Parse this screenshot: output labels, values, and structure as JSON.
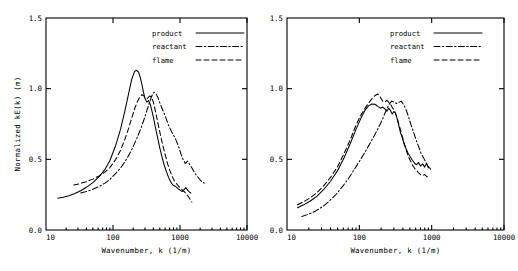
{
  "figure": {
    "panels": [
      {
        "id": "left",
        "axis": {
          "xlabel": "Wavenumber, k (1/m)",
          "ylabel": "Normalized kE(k)  (m)",
          "xticks": [
            "10",
            "100",
            "1000",
            "10000"
          ],
          "yticks": [
            "0.0",
            "0.5",
            "1.0",
            "1.5"
          ]
        },
        "legend": [
          {
            "label": "product",
            "style": "solid"
          },
          {
            "label": "reactant",
            "style": "dashdot"
          },
          {
            "label": "flame",
            "style": "dashed"
          }
        ]
      },
      {
        "id": "right",
        "axis": {
          "xlabel": "Wavenumber, k (1/m)",
          "ylabel": "",
          "xticks": [
            "10",
            "100",
            "1000",
            "10000"
          ],
          "yticks": [
            "0.0",
            "0.5",
            "1.0",
            "1.5"
          ]
        },
        "legend": [
          {
            "label": "product",
            "style": "solid"
          },
          {
            "label": "reactant",
            "style": "dashdot"
          },
          {
            "label": "flame",
            "style": "dashed"
          }
        ]
      }
    ]
  },
  "chart_data": [
    {
      "type": "line",
      "panel": "left",
      "title": "",
      "xlabel": "Wavenumber, k (1/m)",
      "ylabel": "Normalized kE(k)  (m)",
      "xscale": "log",
      "yscale": "linear",
      "xlim": [
        10,
        10000
      ],
      "ylim": [
        0.0,
        1.5
      ],
      "xticks": [
        10,
        100,
        1000,
        10000
      ],
      "yticks": [
        0.0,
        0.5,
        1.0,
        1.5
      ],
      "grid": false,
      "legend_position": "upper-center",
      "series": [
        {
          "name": "product",
          "style": "solid",
          "x": [
            15,
            18,
            22,
            27,
            33,
            40,
            50,
            62,
            75,
            90,
            110,
            130,
            150,
            170,
            190,
            210,
            225,
            240,
            255,
            270,
            285,
            300,
            320,
            340,
            360,
            380,
            400,
            430,
            460,
            500,
            540,
            580,
            620,
            660,
            700,
            750,
            800,
            850,
            900,
            960,
            1020,
            1080,
            1150,
            1220,
            1300,
            1380,
            1450
          ],
          "y": [
            0.225,
            0.232,
            0.243,
            0.258,
            0.278,
            0.302,
            0.335,
            0.378,
            0.425,
            0.492,
            0.6,
            0.715,
            0.84,
            0.96,
            1.065,
            1.122,
            1.13,
            1.118,
            1.08,
            1.03,
            0.975,
            0.93,
            0.905,
            0.915,
            0.89,
            0.845,
            0.8,
            0.725,
            0.66,
            0.58,
            0.515,
            0.46,
            0.42,
            0.385,
            0.355,
            0.33,
            0.315,
            0.31,
            0.3,
            0.288,
            0.28,
            0.272,
            0.285,
            0.3,
            0.282,
            0.27,
            0.262
          ]
        },
        {
          "name": "flame",
          "style": "dashed",
          "x": [
            26,
            32,
            40,
            50,
            62,
            75,
            90,
            110,
            130,
            150,
            170,
            190,
            210,
            230,
            250,
            270,
            290,
            310,
            330,
            350,
            375,
            400,
            420,
            440,
            460,
            490,
            520,
            560,
            600,
            650,
            700,
            760,
            820,
            880,
            950,
            1020,
            1100,
            1180,
            1260,
            1340,
            1420,
            1500
          ],
          "y": [
            0.318,
            0.328,
            0.342,
            0.36,
            0.382,
            0.408,
            0.442,
            0.5,
            0.565,
            0.64,
            0.715,
            0.79,
            0.858,
            0.905,
            0.94,
            0.958,
            0.948,
            0.93,
            0.932,
            0.948,
            0.94,
            0.905,
            0.862,
            0.818,
            0.775,
            0.712,
            0.655,
            0.59,
            0.535,
            0.472,
            0.425,
            0.382,
            0.35,
            0.33,
            0.31,
            0.295,
            0.28,
            0.268,
            0.252,
            0.235,
            0.215,
            0.198
          ]
        },
        {
          "name": "reactant",
          "style": "dashdot",
          "x": [
            33,
            40,
            50,
            62,
            75,
            90,
            110,
            130,
            150,
            175,
            200,
            230,
            260,
            290,
            320,
            350,
            380,
            410,
            440,
            470,
            500,
            540,
            580,
            620,
            670,
            720,
            780,
            840,
            900,
            970,
            1040,
            1120,
            1200,
            1300,
            1400,
            1500,
            1620,
            1750,
            1880,
            2000,
            2150,
            2300
          ],
          "y": [
            0.262,
            0.272,
            0.288,
            0.308,
            0.33,
            0.358,
            0.4,
            0.44,
            0.482,
            0.535,
            0.59,
            0.655,
            0.718,
            0.782,
            0.845,
            0.9,
            0.95,
            0.975,
            0.962,
            0.935,
            0.9,
            0.86,
            0.825,
            0.79,
            0.745,
            0.712,
            0.68,
            0.655,
            0.62,
            0.58,
            0.535,
            0.495,
            0.47,
            0.488,
            0.462,
            0.44,
            0.412,
            0.388,
            0.37,
            0.355,
            0.34,
            0.332
          ]
        }
      ]
    },
    {
      "type": "line",
      "panel": "right",
      "title": "",
      "xlabel": "Wavenumber, k (1/m)",
      "ylabel": "",
      "xscale": "log",
      "yscale": "linear",
      "xlim": [
        10,
        10000
      ],
      "ylim": [
        0.0,
        1.5
      ],
      "xticks": [
        10,
        100,
        1000,
        10000
      ],
      "yticks": [
        0.0,
        0.5,
        1.0,
        1.5
      ],
      "grid": false,
      "legend_position": "upper-center",
      "series": [
        {
          "name": "product",
          "style": "solid",
          "x": [
            14,
            17,
            21,
            26,
            32,
            40,
            50,
            62,
            75,
            90,
            105,
            120,
            135,
            150,
            165,
            180,
            195,
            210,
            225,
            240,
            255,
            270,
            285,
            300,
            315,
            330,
            350,
            370,
            390,
            415,
            440,
            470,
            500,
            540,
            580,
            620,
            660,
            700,
            750,
            800,
            850,
            900
          ],
          "y": [
            0.158,
            0.178,
            0.205,
            0.24,
            0.285,
            0.345,
            0.42,
            0.515,
            0.612,
            0.712,
            0.79,
            0.848,
            0.88,
            0.892,
            0.89,
            0.875,
            0.862,
            0.87,
            0.858,
            0.84,
            0.862,
            0.845,
            0.82,
            0.838,
            0.828,
            0.795,
            0.742,
            0.69,
            0.658,
            0.612,
            0.578,
            0.545,
            0.522,
            0.495,
            0.472,
            0.462,
            0.478,
            0.452,
            0.468,
            0.445,
            0.47,
            0.44
          ]
        },
        {
          "name": "flame",
          "style": "dashed",
          "x": [
            14,
            17,
            21,
            26,
            32,
            40,
            50,
            62,
            75,
            90,
            105,
            120,
            135,
            150,
            165,
            180,
            195,
            210,
            225,
            240,
            255,
            270,
            290,
            310,
            330,
            355,
            380,
            410,
            440,
            475,
            510,
            550,
            590,
            640,
            690,
            740,
            800,
            860,
            920
          ],
          "y": [
            0.178,
            0.2,
            0.228,
            0.265,
            0.312,
            0.372,
            0.448,
            0.545,
            0.64,
            0.742,
            0.812,
            0.862,
            0.9,
            0.93,
            0.952,
            0.962,
            0.94,
            0.912,
            0.905,
            0.918,
            0.905,
            0.888,
            0.862,
            0.838,
            0.8,
            0.742,
            0.688,
            0.625,
            0.572,
            0.522,
            0.488,
            0.455,
            0.432,
            0.412,
            0.395,
            0.385,
            0.392,
            0.378,
            0.37
          ]
        },
        {
          "name": "reactant",
          "style": "dashdot",
          "x": [
            16,
            20,
            25,
            31,
            38,
            47,
            58,
            70,
            85,
            100,
            120,
            140,
            160,
            180,
            200,
            220,
            240,
            260,
            280,
            300,
            325,
            350,
            380,
            410,
            440,
            480,
            520,
            560,
            610,
            660,
            710,
            770,
            830,
            900,
            970
          ],
          "y": [
            0.095,
            0.112,
            0.135,
            0.165,
            0.202,
            0.248,
            0.305,
            0.36,
            0.428,
            0.485,
            0.552,
            0.612,
            0.665,
            0.715,
            0.762,
            0.812,
            0.858,
            0.892,
            0.912,
            0.905,
            0.895,
            0.902,
            0.912,
            0.885,
            0.855,
            0.8,
            0.742,
            0.695,
            0.638,
            0.59,
            0.545,
            0.512,
            0.478,
            0.448,
            0.43
          ]
        }
      ]
    }
  ]
}
